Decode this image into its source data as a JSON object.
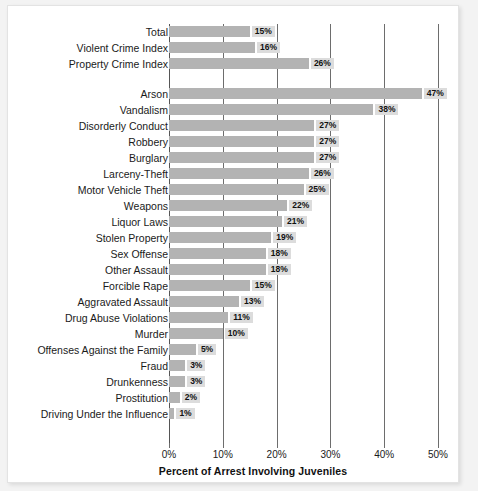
{
  "chart_data": {
    "type": "bar",
    "orientation": "horizontal",
    "title": "",
    "xlabel": "Percent of Arrest Involving Juveniles",
    "ylabel": "",
    "xlim": [
      0,
      50
    ],
    "xticks": [
      "0%",
      "10%",
      "20%",
      "30%",
      "40%",
      "50%"
    ],
    "xtick_values": [
      0,
      10,
      20,
      30,
      40,
      50
    ],
    "grid": true,
    "legend": false,
    "value_suffix": "%",
    "bar_color": "#b3b3b3",
    "label_bg_color": "#dcdcdc",
    "gridline_color": "#6d6d6d",
    "categories": [
      "Total",
      "Violent Crime Index",
      "Property Crime Index",
      "Arson",
      "Vandalism",
      "Disorderly Conduct",
      "Robbery",
      "Burglary",
      "Larceny-Theft",
      "Motor Vehicle Theft",
      "Weapons",
      "Liquor Laws",
      "Stolen Property",
      "Sex Offense",
      "Other Assault",
      "Forcible Rape",
      "Aggravated Assault",
      "Drug Abuse Violations",
      "Murder",
      "Offenses Against the Family",
      "Fraud",
      "Drunkenness",
      "Prostitution",
      "Driving Under the Influence"
    ],
    "values": [
      15,
      16,
      26,
      47,
      38,
      27,
      27,
      27,
      26,
      25,
      22,
      21,
      19,
      18,
      18,
      15,
      13,
      11,
      10,
      5,
      3,
      3,
      2,
      1
    ],
    "value_labels": [
      "15%",
      "16%",
      "26%",
      "47%",
      "38%",
      "27%",
      "27%",
      "27%",
      "26%",
      "25%",
      "22%",
      "21%",
      "19%",
      "18%",
      "18%",
      "15%",
      "13%",
      "11%",
      "10%",
      "5%",
      "3%",
      "3%",
      "2%",
      "1%"
    ],
    "group_break_after_index": 2
  }
}
